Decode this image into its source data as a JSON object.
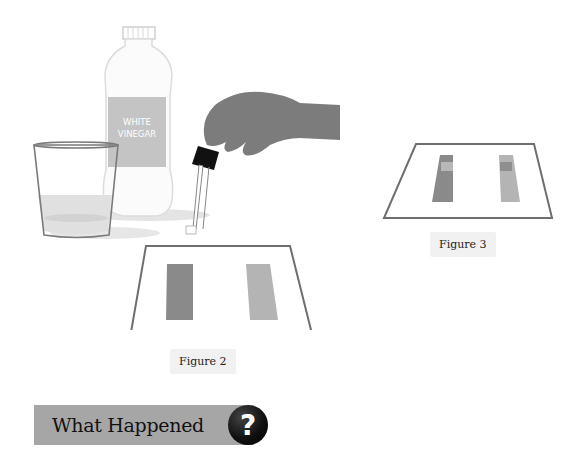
{
  "figure2": {
    "illustration": {
      "bottle_label": [
        "WHITE",
        "VINEGAR"
      ],
      "objects": [
        "glass-of-water",
        "vinegar-bottle",
        "hand-with-dropper",
        "paper-with-two-strips"
      ]
    },
    "caption": "Figure 2"
  },
  "figure3": {
    "illustration": {
      "objects": [
        "paper-with-two-strips-spotted"
      ]
    },
    "caption": "Figure 3"
  },
  "section": {
    "title": "What Happened",
    "icon": "question-mark-icon",
    "icon_glyph": "?"
  },
  "colors": {
    "strip_dark": "#8a8a8a",
    "strip_light": "#b4b4b4",
    "paper_border": "#6e6e6e",
    "label_bg": "#f1f1f1",
    "header_bg": "#a6a6a6",
    "bottle_label_bg": "#c4c4c4"
  }
}
